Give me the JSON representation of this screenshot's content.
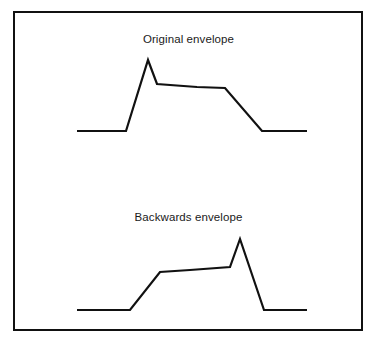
{
  "figure": {
    "background_color": "#ffffff",
    "frame": {
      "border_color": "#111111",
      "x": 13,
      "y": 11,
      "width": 350,
      "height": 320
    },
    "stroke_color": "#111111"
  },
  "panels": [
    {
      "id": "original",
      "caption": "Original envelope",
      "caption_y": 45
    },
    {
      "id": "backwards",
      "caption": "Backwards envelope",
      "caption_y": 223
    }
  ],
  "chart_data": [
    {
      "type": "line",
      "title": "Original envelope",
      "xlabel": "",
      "ylabel": "",
      "grid": false,
      "legend": "none",
      "axes_visible": false,
      "description": "Amplitude envelope with fast attack, sharp peak, slow sustain decay and release to silence.",
      "x": [
        77,
        126,
        148,
        157,
        197,
        225,
        262,
        307
      ],
      "y": [
        131,
        131,
        60,
        84,
        87,
        88,
        131,
        131
      ],
      "points": [
        {
          "x": 77,
          "y": 131,
          "label": "start-silence"
        },
        {
          "x": 126,
          "y": 131,
          "label": "attack-start"
        },
        {
          "x": 148,
          "y": 60,
          "label": "peak"
        },
        {
          "x": 157,
          "y": 84,
          "label": "decay-to-sustain"
        },
        {
          "x": 197,
          "y": 87,
          "label": "sustain-mid"
        },
        {
          "x": 225,
          "y": 88,
          "label": "sustain-end"
        },
        {
          "x": 262,
          "y": 131,
          "label": "release-end"
        },
        {
          "x": 307,
          "y": 131,
          "label": "end-silence"
        }
      ],
      "xlim": [
        77,
        307
      ],
      "ylim": [
        131,
        60
      ]
    },
    {
      "type": "line",
      "title": "Backwards envelope",
      "xlabel": "",
      "ylabel": "",
      "grid": false,
      "legend": "none",
      "axes_visible": false,
      "description": "Time-reversed amplitude envelope: slow rise, rising sustain, sharp peak, then fast drop to silence.",
      "x": [
        77,
        130,
        160,
        190,
        230,
        240,
        264,
        307
      ],
      "y": [
        310,
        310,
        272,
        270,
        267,
        239,
        310,
        310
      ],
      "points": [
        {
          "x": 77,
          "y": 310,
          "label": "start-silence"
        },
        {
          "x": 130,
          "y": 310,
          "label": "slow-rise-start"
        },
        {
          "x": 160,
          "y": 272,
          "label": "sustain-start"
        },
        {
          "x": 190,
          "y": 270,
          "label": "sustain-mid"
        },
        {
          "x": 230,
          "y": 267,
          "label": "sustain-end"
        },
        {
          "x": 240,
          "y": 239,
          "label": "peak"
        },
        {
          "x": 264,
          "y": 310,
          "label": "fast-drop-end"
        },
        {
          "x": 307,
          "y": 310,
          "label": "end-silence"
        }
      ],
      "xlim": [
        77,
        307
      ],
      "ylim": [
        310,
        239
      ]
    }
  ]
}
